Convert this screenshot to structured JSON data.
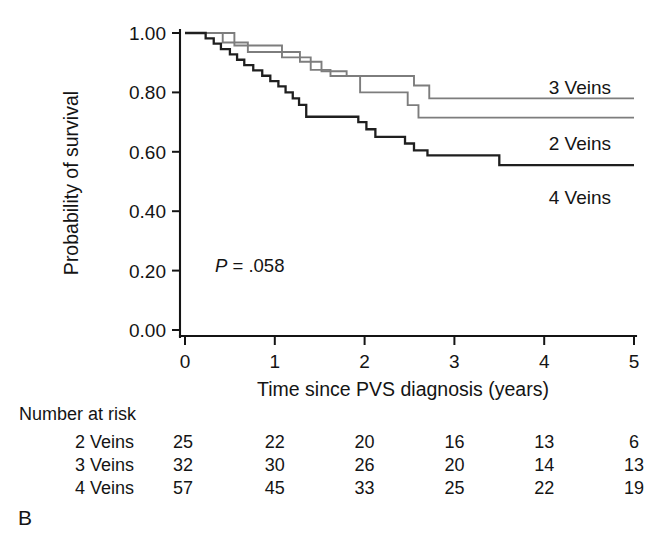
{
  "panel": {
    "letter": "B"
  },
  "chart_data": {
    "type": "line",
    "subtype": "kaplan-meier-step",
    "title": "",
    "xlabel": "Time since PVS diagnosis (years)",
    "ylabel": "Probability of survival",
    "xlim": [
      0,
      5
    ],
    "ylim": [
      0.0,
      1.0
    ],
    "xticks": [
      0,
      1,
      2,
      3,
      4,
      5
    ],
    "xtick_labels": [
      "0",
      "1",
      "2",
      "3",
      "4",
      "5"
    ],
    "yticks": [
      0.0,
      0.2,
      0.4,
      0.6,
      0.8,
      1.0
    ],
    "ytick_labels": [
      "0.00",
      "0.20",
      "0.40",
      "0.60",
      "0.80",
      "1.00"
    ],
    "grid": false,
    "legend_position": "right-inline",
    "annotations": [
      {
        "name": "p-value",
        "text_italic": "P",
        "text_rest": " =  .058",
        "x": 0.55,
        "y": 0.215
      }
    ],
    "series": [
      {
        "name": "3 Veins",
        "color": "#7d7d7d",
        "label": "3 Veins",
        "label_x": 4.05,
        "label_y": 0.815,
        "final_value": 0.78,
        "points": [
          [
            0.0,
            1.0
          ],
          [
            0.42,
            1.0
          ],
          [
            0.42,
            0.968
          ],
          [
            0.7,
            0.968
          ],
          [
            0.7,
            0.936
          ],
          [
            1.28,
            0.936
          ],
          [
            1.28,
            0.903
          ],
          [
            1.52,
            0.903
          ],
          [
            1.52,
            0.871
          ],
          [
            1.8,
            0.871
          ],
          [
            1.8,
            0.855
          ],
          [
            2.55,
            0.855
          ],
          [
            2.55,
            0.823
          ],
          [
            2.72,
            0.823
          ],
          [
            2.72,
            0.78
          ],
          [
            5.0,
            0.78
          ]
        ]
      },
      {
        "name": "2 Veins",
        "color": "#7d7d7d",
        "label": "2 Veins",
        "label_x": 4.05,
        "label_y": 0.625,
        "final_value": 0.715,
        "points": [
          [
            0.0,
            1.0
          ],
          [
            0.55,
            1.0
          ],
          [
            0.55,
            0.958
          ],
          [
            1.08,
            0.958
          ],
          [
            1.08,
            0.918
          ],
          [
            1.4,
            0.918
          ],
          [
            1.4,
            0.876
          ],
          [
            1.62,
            0.876
          ],
          [
            1.62,
            0.855
          ],
          [
            1.95,
            0.855
          ],
          [
            1.95,
            0.8
          ],
          [
            2.48,
            0.8
          ],
          [
            2.48,
            0.757
          ],
          [
            2.6,
            0.757
          ],
          [
            2.6,
            0.715
          ],
          [
            5.0,
            0.715
          ]
        ]
      },
      {
        "name": "4 Veins",
        "color": "#1f1f1f",
        "label": "4 Veins",
        "label_x": 4.05,
        "label_y": 0.445,
        "final_value": 0.555,
        "points": [
          [
            0.0,
            1.0
          ],
          [
            0.23,
            1.0
          ],
          [
            0.23,
            0.982
          ],
          [
            0.32,
            0.982
          ],
          [
            0.32,
            0.964
          ],
          [
            0.4,
            0.964
          ],
          [
            0.4,
            0.946
          ],
          [
            0.5,
            0.946
          ],
          [
            0.5,
            0.928
          ],
          [
            0.58,
            0.928
          ],
          [
            0.58,
            0.91
          ],
          [
            0.66,
            0.91
          ],
          [
            0.66,
            0.892
          ],
          [
            0.76,
            0.892
          ],
          [
            0.76,
            0.874
          ],
          [
            0.86,
            0.874
          ],
          [
            0.86,
            0.856
          ],
          [
            0.95,
            0.856
          ],
          [
            0.95,
            0.838
          ],
          [
            1.04,
            0.838
          ],
          [
            1.04,
            0.82
          ],
          [
            1.12,
            0.82
          ],
          [
            1.12,
            0.8
          ],
          [
            1.2,
            0.8
          ],
          [
            1.2,
            0.78
          ],
          [
            1.27,
            0.78
          ],
          [
            1.27,
            0.758
          ],
          [
            1.35,
            0.758
          ],
          [
            1.35,
            0.718
          ],
          [
            1.93,
            0.718
          ],
          [
            1.93,
            0.7
          ],
          [
            2.02,
            0.7
          ],
          [
            2.02,
            0.676
          ],
          [
            2.12,
            0.676
          ],
          [
            2.12,
            0.65
          ],
          [
            2.45,
            0.65
          ],
          [
            2.45,
            0.628
          ],
          [
            2.55,
            0.628
          ],
          [
            2.55,
            0.605
          ],
          [
            2.7,
            0.605
          ],
          [
            2.7,
            0.588
          ],
          [
            3.5,
            0.588
          ],
          [
            3.5,
            0.555
          ],
          [
            5.0,
            0.555
          ]
        ]
      }
    ]
  },
  "risk_table": {
    "title": "Number at risk",
    "columns": [
      "0",
      "1",
      "2",
      "3",
      "4",
      "5"
    ],
    "rows": [
      {
        "label": "2 Veins",
        "values": [
          "25",
          "22",
          "20",
          "16",
          "13",
          "6"
        ]
      },
      {
        "label": "3 Veins",
        "values": [
          "32",
          "30",
          "26",
          "20",
          "14",
          "13"
        ]
      },
      {
        "label": "4 Veins",
        "values": [
          "57",
          "45",
          "33",
          "25",
          "22",
          "19"
        ]
      }
    ]
  },
  "colors": {
    "axis": "#141414",
    "gray_series": "#7d7d7d",
    "black_series": "#1f1f1f",
    "background": "#ffffff"
  }
}
